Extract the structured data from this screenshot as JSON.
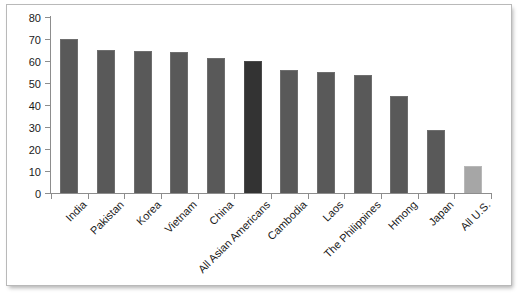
{
  "chart_data": {
    "type": "bar",
    "title": "",
    "subtitle": "",
    "xlabel": "",
    "ylabel": "",
    "ylim": [
      0,
      80
    ],
    "ytick_step": 10,
    "grid": false,
    "legend": "none",
    "categories": [
      "India",
      "Pakistan",
      "Korea",
      "Vietnam",
      "China",
      "All Asian Americans",
      "Cambodia",
      "Laos",
      "The Philippines",
      "Hmong",
      "Japan",
      "All U.S."
    ],
    "values": [
      70,
      65,
      64.5,
      64,
      61.5,
      60,
      56,
      55,
      53.5,
      44,
      28.5,
      12.5
    ],
    "yticks": [
      "0",
      "10",
      "20",
      "30",
      "40",
      "50",
      "60",
      "70",
      "80"
    ],
    "bar_styles": [
      "normal",
      "normal",
      "normal",
      "normal",
      "normal",
      "highlight",
      "normal",
      "normal",
      "normal",
      "normal",
      "normal",
      "light"
    ],
    "colors": {
      "bar_normal": "#595959",
      "bar_highlight": "#333333",
      "bar_light": "#a6a6a6",
      "axis": "#8d8d8d",
      "text": "#1a1a1a",
      "frame": "#b9b9b9",
      "background": "#ffffff"
    }
  }
}
